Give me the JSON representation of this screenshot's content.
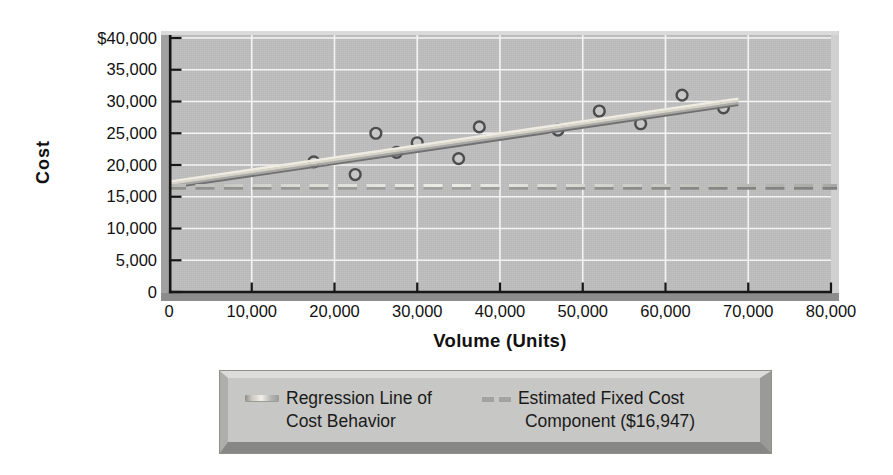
{
  "figure": {
    "x_axis_title": "Volume (Units)",
    "y_axis_title": "Cost"
  },
  "legend": {
    "items": [
      {
        "swatch": "regression-line-swatch",
        "line1": "Regression Line of",
        "line2": "Cost Behavior"
      },
      {
        "swatch": "fixed-cost-dash-swatch",
        "line1": "Estimated Fixed Cost",
        "line2": "Component ($16,947)"
      }
    ]
  },
  "chart_data": {
    "type": "scatter",
    "title": "",
    "xlabel": "Volume (Units)",
    "ylabel": "Cost",
    "xlim": [
      0,
      80000
    ],
    "ylim": [
      0,
      40000
    ],
    "grid": "on",
    "legend_position": "bottom",
    "x_ticks": [
      0,
      10000,
      20000,
      30000,
      40000,
      50000,
      60000,
      70000,
      80000
    ],
    "x_tick_labels": [
      "0",
      "10,000",
      "20,000",
      "30,000",
      "40,000",
      "50,000",
      "60,000",
      "70,000",
      "80,000"
    ],
    "y_ticks": [
      0,
      5000,
      10000,
      15000,
      20000,
      25000,
      30000,
      35000,
      40000
    ],
    "y_tick_labels": [
      "0",
      "5,000",
      "10,000",
      "15,000",
      "20,000",
      "25,000",
      "30,000",
      "35,000",
      "$40,000"
    ],
    "series": [
      {
        "name": "Observed cost-volume data",
        "type": "scatter",
        "points": [
          [
            17500,
            20500
          ],
          [
            22500,
            18500
          ],
          [
            25000,
            25000
          ],
          [
            27500,
            22000
          ],
          [
            30000,
            23500
          ],
          [
            35000,
            21000
          ],
          [
            37500,
            26000
          ],
          [
            47000,
            25500
          ],
          [
            52000,
            28500
          ],
          [
            57000,
            26500
          ],
          [
            62000,
            31000
          ],
          [
            67000,
            29000
          ]
        ]
      },
      {
        "name": "Regression Line of Cost Behavior",
        "type": "line",
        "intercept": 16947,
        "slope": 0.19,
        "x_range": [
          0,
          68800
        ]
      },
      {
        "name": "Estimated Fixed Cost Component ($16,947)",
        "type": "dashed-horizontal-line",
        "value": 16947
      }
    ],
    "colors": {
      "plot_background": "#bcbcbc",
      "gridline": "#f4f4f4",
      "axis": "#161616",
      "tick_label": "#111111",
      "marker_ring": "#4d4d4d",
      "marker_fill": "#c8c8c8",
      "regression_highlight": "#eeece2",
      "regression_shadow": "#707070",
      "dash_light": "#ebebe7",
      "dash_dark": "#8e8e8c",
      "legend_background": "#c7c7c5",
      "page_background": "#ffffff"
    }
  }
}
